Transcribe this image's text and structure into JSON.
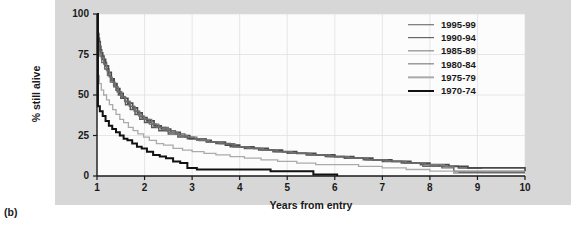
{
  "figure": {
    "panel_label": "(b)",
    "background_color": "#d7d7d7",
    "plot_background_color": "#fcfcfc"
  },
  "axes": {
    "x_title": "Years from entry",
    "y_title": "% still alive",
    "x_ticks": [
      "1",
      "2",
      "3",
      "4",
      "5",
      "6",
      "7",
      "8",
      "9",
      "10"
    ],
    "y_ticks": [
      "0",
      "25",
      "50",
      "75",
      "100"
    ]
  },
  "legend": {
    "position": "top-right",
    "items": [
      {
        "label": "1995-99",
        "color": "#595959",
        "width": 1.5
      },
      {
        "label": "1990-94",
        "color": "#4a4a4a",
        "width": 1.7
      },
      {
        "label": "1985-89",
        "color": "#767676",
        "width": 1.3
      },
      {
        "label": "1980-84",
        "color": "#6a6a6a",
        "width": 1.3
      },
      {
        "label": "1975-79",
        "color": "#aaaaaa",
        "width": 1.3
      },
      {
        "label": "1970-74",
        "color": "#111111",
        "width": 2.0
      }
    ]
  },
  "chart_data": {
    "type": "line",
    "title": "",
    "xlabel": "Years from entry",
    "ylabel": "% still alive",
    "xlim": [
      1,
      10
    ],
    "ylim": [
      0,
      100
    ],
    "grid": true,
    "legend_position": "top-right",
    "x_ticks": [
      1,
      2,
      3,
      4,
      5,
      6,
      7,
      8,
      9,
      10
    ],
    "y_ticks": [
      0,
      25,
      50,
      75,
      100
    ],
    "series": [
      {
        "name": "1995-99",
        "color": "#595959",
        "width": 1.5,
        "points": [
          [
            1.0,
            100
          ],
          [
            1.02,
            88
          ],
          [
            1.04,
            83
          ],
          [
            1.07,
            78
          ],
          [
            1.1,
            74
          ],
          [
            1.15,
            70
          ],
          [
            1.2,
            66
          ],
          [
            1.25,
            62
          ],
          [
            1.3,
            59
          ],
          [
            1.35,
            56
          ],
          [
            1.4,
            53
          ],
          [
            1.45,
            50
          ],
          [
            1.5,
            48
          ],
          [
            1.6,
            44
          ],
          [
            1.7,
            41
          ],
          [
            1.8,
            38
          ],
          [
            1.9,
            35
          ],
          [
            2.0,
            33
          ],
          [
            2.15,
            30
          ],
          [
            2.3,
            28
          ],
          [
            2.5,
            26
          ],
          [
            2.7,
            24
          ],
          [
            2.9,
            23
          ],
          [
            3.1,
            22
          ],
          [
            3.3,
            21
          ],
          [
            3.5,
            20
          ],
          [
            3.8,
            18
          ],
          [
            4.1,
            17
          ],
          [
            4.4,
            16
          ],
          [
            4.7,
            15
          ],
          [
            5.0,
            14
          ],
          [
            5.4,
            13
          ],
          [
            5.8,
            12
          ],
          [
            6.2,
            11
          ],
          [
            6.6,
            10
          ],
          [
            7.0,
            9
          ],
          [
            7.4,
            8
          ],
          [
            7.8,
            7
          ],
          [
            8.2,
            6
          ],
          [
            8.6,
            5
          ],
          [
            9.1,
            5
          ]
        ]
      },
      {
        "name": "1990-94",
        "color": "#4a4a4a",
        "width": 1.7,
        "points": [
          [
            1.0,
            100
          ],
          [
            1.02,
            85
          ],
          [
            1.05,
            80
          ],
          [
            1.08,
            76
          ],
          [
            1.12,
            72
          ],
          [
            1.18,
            68
          ],
          [
            1.24,
            64
          ],
          [
            1.3,
            60
          ],
          [
            1.36,
            57
          ],
          [
            1.42,
            54
          ],
          [
            1.48,
            51
          ],
          [
            1.55,
            48
          ],
          [
            1.65,
            45
          ],
          [
            1.75,
            42
          ],
          [
            1.85,
            39
          ],
          [
            1.95,
            36
          ],
          [
            2.05,
            34
          ],
          [
            2.2,
            31
          ],
          [
            2.35,
            29
          ],
          [
            2.55,
            27
          ],
          [
            2.75,
            25
          ],
          [
            2.95,
            23
          ],
          [
            3.15,
            22
          ],
          [
            3.4,
            21
          ],
          [
            3.7,
            19
          ],
          [
            4.0,
            18
          ],
          [
            4.3,
            17
          ],
          [
            4.6,
            16
          ],
          [
            4.9,
            15
          ],
          [
            5.2,
            14
          ],
          [
            5.6,
            13
          ],
          [
            6.0,
            12
          ],
          [
            6.4,
            11
          ],
          [
            6.8,
            10
          ],
          [
            7.2,
            9
          ],
          [
            7.6,
            8
          ],
          [
            8.0,
            7
          ],
          [
            8.4,
            6
          ],
          [
            8.8,
            5
          ],
          [
            9.2,
            5
          ],
          [
            10.0,
            3
          ]
        ]
      },
      {
        "name": "1985-89",
        "color": "#767676",
        "width": 1.3,
        "points": [
          [
            1.0,
            100
          ],
          [
            1.02,
            82
          ],
          [
            1.05,
            77
          ],
          [
            1.09,
            73
          ],
          [
            1.14,
            69
          ],
          [
            1.2,
            65
          ],
          [
            1.26,
            61
          ],
          [
            1.32,
            58
          ],
          [
            1.38,
            55
          ],
          [
            1.45,
            52
          ],
          [
            1.52,
            49
          ],
          [
            1.6,
            46
          ],
          [
            1.7,
            43
          ],
          [
            1.8,
            40
          ],
          [
            1.9,
            37
          ],
          [
            2.0,
            35
          ],
          [
            2.15,
            32
          ],
          [
            2.3,
            30
          ],
          [
            2.5,
            27
          ],
          [
            2.7,
            25
          ],
          [
            2.9,
            24
          ],
          [
            3.1,
            22
          ],
          [
            3.35,
            21
          ],
          [
            3.6,
            20
          ],
          [
            3.9,
            18
          ],
          [
            4.2,
            17
          ],
          [
            4.5,
            16
          ],
          [
            4.8,
            15
          ],
          [
            5.1,
            14
          ],
          [
            5.5,
            13
          ],
          [
            5.9,
            12
          ],
          [
            6.3,
            11
          ],
          [
            6.7,
            10
          ],
          [
            7.1,
            9
          ],
          [
            7.5,
            8
          ],
          [
            7.9,
            7
          ],
          [
            8.3,
            6
          ],
          [
            8.5,
            3
          ],
          [
            9.0,
            3
          ],
          [
            10.0,
            3
          ]
        ]
      },
      {
        "name": "1980-84",
        "color": "#6a6a6a",
        "width": 1.3,
        "points": [
          [
            1.0,
            100
          ],
          [
            1.02,
            80
          ],
          [
            1.06,
            74
          ],
          [
            1.1,
            70
          ],
          [
            1.16,
            66
          ],
          [
            1.22,
            62
          ],
          [
            1.28,
            58
          ],
          [
            1.35,
            55
          ],
          [
            1.42,
            52
          ],
          [
            1.5,
            49
          ],
          [
            1.58,
            46
          ],
          [
            1.68,
            43
          ],
          [
            1.78,
            40
          ],
          [
            1.88,
            37
          ],
          [
            1.98,
            35
          ],
          [
            2.1,
            32
          ],
          [
            2.25,
            30
          ],
          [
            2.45,
            28
          ],
          [
            2.65,
            26
          ],
          [
            2.85,
            24
          ],
          [
            3.05,
            23
          ],
          [
            3.3,
            21
          ],
          [
            3.55,
            20
          ],
          [
            3.85,
            18
          ],
          [
            4.15,
            17
          ],
          [
            4.45,
            16
          ],
          [
            4.75,
            15
          ],
          [
            5.05,
            14
          ],
          [
            5.45,
            13
          ],
          [
            5.85,
            12
          ],
          [
            6.25,
            11
          ],
          [
            6.65,
            10
          ],
          [
            7.05,
            9
          ],
          [
            7.45,
            8
          ],
          [
            7.85,
            6
          ],
          [
            8.25,
            5
          ],
          [
            8.5,
            2
          ],
          [
            9.0,
            2
          ],
          [
            10.0,
            2
          ]
        ]
      },
      {
        "name": "1975-79",
        "color": "#aaaaaa",
        "width": 1.3,
        "points": [
          [
            1.0,
            100
          ],
          [
            1.02,
            62
          ],
          [
            1.05,
            57
          ],
          [
            1.09,
            53
          ],
          [
            1.14,
            50
          ],
          [
            1.2,
            47
          ],
          [
            1.26,
            44
          ],
          [
            1.33,
            41
          ],
          [
            1.4,
            38
          ],
          [
            1.48,
            35
          ],
          [
            1.56,
            33
          ],
          [
            1.66,
            30
          ],
          [
            1.76,
            28
          ],
          [
            1.86,
            26
          ],
          [
            1.98,
            24
          ],
          [
            2.1,
            22
          ],
          [
            2.25,
            20
          ],
          [
            2.4,
            19
          ],
          [
            2.6,
            17
          ],
          [
            2.8,
            16
          ],
          [
            3.0,
            15
          ],
          [
            3.25,
            14
          ],
          [
            3.5,
            13
          ],
          [
            3.8,
            12
          ],
          [
            4.1,
            11
          ],
          [
            4.45,
            10
          ],
          [
            4.8,
            9
          ],
          [
            5.2,
            8
          ],
          [
            5.6,
            7
          ],
          [
            6.0,
            7
          ],
          [
            6.5,
            6
          ],
          [
            7.0,
            5
          ],
          [
            7.5,
            4
          ],
          [
            8.0,
            3
          ],
          [
            8.5,
            2
          ],
          [
            8.6,
            2
          ]
        ]
      },
      {
        "name": "1970-74",
        "color": "#111111",
        "width": 2.0,
        "points": [
          [
            1.0,
            100
          ],
          [
            1.02,
            43
          ],
          [
            1.06,
            40
          ],
          [
            1.12,
            37
          ],
          [
            1.18,
            34
          ],
          [
            1.25,
            31
          ],
          [
            1.32,
            29
          ],
          [
            1.4,
            27
          ],
          [
            1.48,
            25
          ],
          [
            1.56,
            23
          ],
          [
            1.64,
            22
          ],
          [
            1.74,
            20
          ],
          [
            1.84,
            18
          ],
          [
            1.94,
            17
          ],
          [
            2.05,
            15
          ],
          [
            2.18,
            13
          ],
          [
            2.32,
            12
          ],
          [
            2.45,
            11
          ],
          [
            2.6,
            9
          ],
          [
            2.75,
            8
          ],
          [
            2.9,
            5
          ],
          [
            3.1,
            4
          ],
          [
            3.5,
            4
          ],
          [
            4.0,
            4
          ],
          [
            4.5,
            4
          ],
          [
            4.65,
            3
          ],
          [
            5.0,
            3
          ],
          [
            5.45,
            3
          ],
          [
            5.55,
            1
          ],
          [
            6.0,
            1
          ],
          [
            6.05,
            0
          ]
        ]
      }
    ]
  }
}
